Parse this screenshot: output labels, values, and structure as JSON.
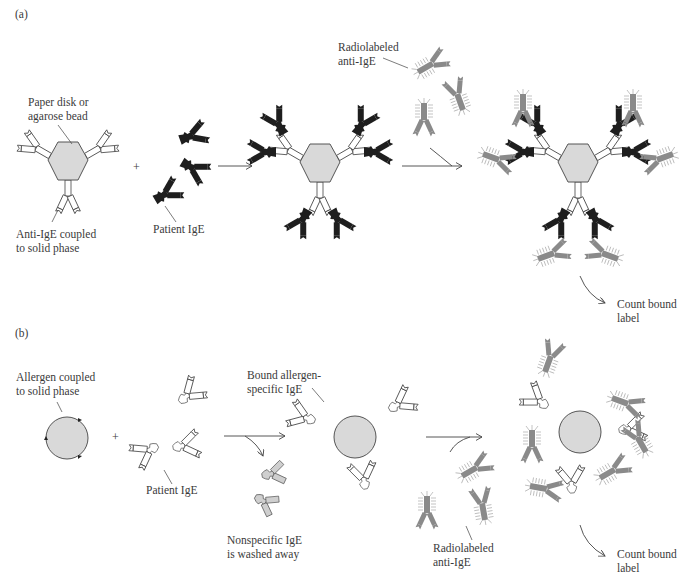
{
  "figure": {
    "panel_a": {
      "label": "(a)",
      "solid_phase_label": [
        "Paper disk or",
        "agarose bead"
      ],
      "coupled_label": [
        "Anti-IgE coupled",
        "to solid phase"
      ],
      "patient_label": "Patient IgE",
      "radiolabel_label": [
        "Radiolabeled",
        "anti-IgE"
      ],
      "count_label": [
        "Count bound",
        "label"
      ],
      "plus": "+"
    },
    "panel_b": {
      "label": "(b)",
      "solid_phase_label": [
        "Allergen coupled",
        "to solid phase"
      ],
      "patient_label": "Patient IgE",
      "bound_label": [
        "Bound allergen-",
        "specific IgE"
      ],
      "washed_label": [
        "Nonspecific IgE",
        "is washed away"
      ],
      "radiolabel_label": [
        "Radiolabeled",
        "anti-IgE"
      ],
      "count_label": [
        "Count bound",
        "label"
      ],
      "plus": "+"
    },
    "colors": {
      "solid_phase_fill": "#d9d9d9",
      "patient_ige_a": "#1e1e1e",
      "radiolabeled": "#8a8a8a",
      "outline": "#444444"
    }
  }
}
